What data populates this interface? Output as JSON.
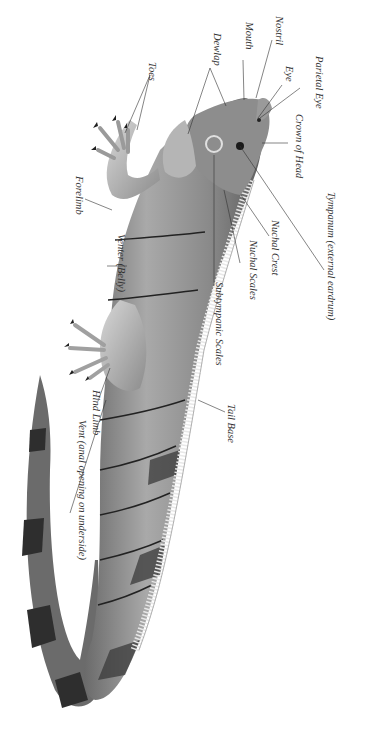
{
  "diagram": {
    "orientation": "rotated 90deg clockwise",
    "labels": [
      {
        "id": "nostril",
        "text": "Nostril",
        "x": 284,
        "y": 16
      },
      {
        "id": "mouth",
        "text": "Mouth",
        "x": 254,
        "y": 22
      },
      {
        "id": "parietal-eye",
        "text": "Parietal Eye",
        "x": 324,
        "y": 56
      },
      {
        "id": "eye",
        "text": "Eye",
        "x": 294,
        "y": 66
      },
      {
        "id": "dewlap",
        "text": "Dewlap",
        "x": 222,
        "y": 33
      },
      {
        "id": "crown-of-head",
        "text": "Crown of Head",
        "x": 304,
        "y": 114
      },
      {
        "id": "toes",
        "text": "Toes",
        "x": 157,
        "y": 62
      },
      {
        "id": "forelimb",
        "text": "Forelimb",
        "x": 84,
        "y": 176
      },
      {
        "id": "tympanum",
        "text": "Tympanum (external eardrum)",
        "x": 336,
        "y": 192
      },
      {
        "id": "nuchal-crest",
        "text": "Nuchal Crest",
        "x": 280,
        "y": 220
      },
      {
        "id": "nuchal-scales",
        "text": "Nuchal Scales",
        "x": 258,
        "y": 240
      },
      {
        "id": "venter",
        "text": "Venter (Belly)",
        "x": 126,
        "y": 234
      },
      {
        "id": "subtympanic-scales",
        "text": "Subtympanic Scales",
        "x": 224,
        "y": 282
      },
      {
        "id": "tail-base",
        "text": "Tail Base",
        "x": 236,
        "y": 404
      },
      {
        "id": "hind-limb",
        "text": "Hind Limb",
        "x": 101,
        "y": 390
      },
      {
        "id": "vent",
        "text": "Vent (anal opening on underside)",
        "x": 87,
        "y": 420
      }
    ]
  }
}
